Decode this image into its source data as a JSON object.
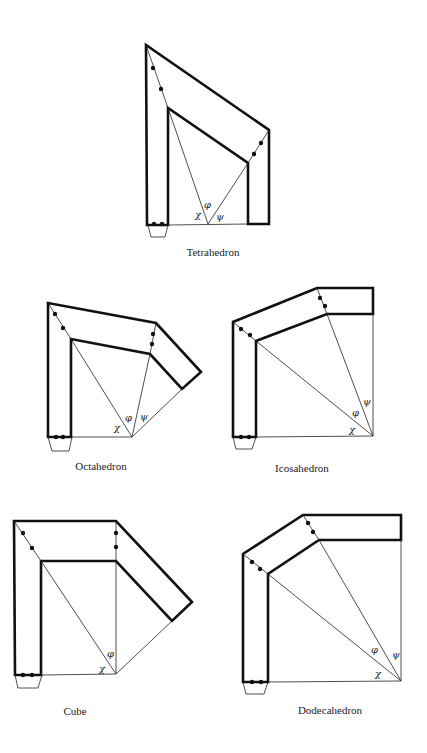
{
  "figure": {
    "diagrams": [
      {
        "id": "tetrahedron",
        "label": "Tetrahedron",
        "angles": [
          "χ",
          "φ",
          "ψ"
        ]
      },
      {
        "id": "octahedron",
        "label": "Octahedron",
        "angles": [
          "χ",
          "φ",
          "ψ"
        ]
      },
      {
        "id": "icosahedron",
        "label": "Icosahedron",
        "angles": [
          "ψ",
          "φ",
          "χ"
        ]
      },
      {
        "id": "cube",
        "label": "Cube",
        "angles": [
          "φ",
          "χ"
        ]
      },
      {
        "id": "dodecahedron",
        "label": "Dodecahedron",
        "angles": [
          "φ",
          "ψ",
          "χ"
        ]
      }
    ],
    "colors": {
      "line": "#111111",
      "background": "#ffffff"
    }
  }
}
